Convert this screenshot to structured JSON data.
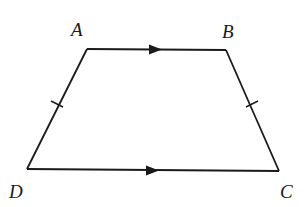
{
  "diagram": {
    "type": "isosceles-trapezoid",
    "stroke_color": "#1a1a1a",
    "background": "#ffffff",
    "vertices": {
      "A": {
        "label": "A",
        "x": 87,
        "y": 49
      },
      "B": {
        "label": "B",
        "x": 226,
        "y": 50
      },
      "C": {
        "label": "C",
        "x": 279,
        "y": 171
      },
      "D": {
        "label": "D",
        "x": 27,
        "y": 169
      }
    },
    "edges": [
      {
        "from": "A",
        "to": "B",
        "marker": "parallel-arrow"
      },
      {
        "from": "B",
        "to": "C",
        "marker": "equal-tick"
      },
      {
        "from": "C",
        "to": "D",
        "marker": "parallel-arrow"
      },
      {
        "from": "D",
        "to": "A",
        "marker": "equal-tick"
      }
    ],
    "labels": {
      "A": "A",
      "B": "B",
      "C": "C",
      "D": "D"
    }
  }
}
